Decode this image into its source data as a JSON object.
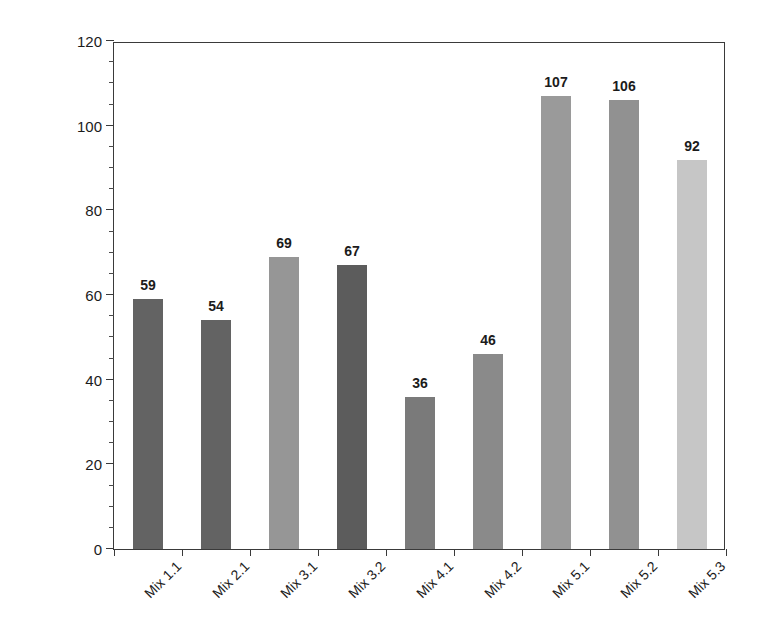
{
  "chart_data": {
    "type": "bar",
    "title": "",
    "xlabel": "",
    "ylabel": "Modulus of Stiffness, (MPa)",
    "categories": [
      "Mix 1.1",
      "Mix 2.1",
      "Mix 3.1",
      "Mix 3.2",
      "Mix 4.1",
      "Mix 4.2",
      "Mix 5.1",
      "Mix 5.2",
      "Mix 5.3"
    ],
    "values": [
      59,
      54,
      69,
      67,
      36,
      46,
      107,
      106,
      92
    ],
    "value_labels": [
      "59",
      "54",
      "69",
      "67",
      "36",
      "46",
      "107",
      "106",
      "92"
    ],
    "bar_colors": [
      "#636363",
      "#636363",
      "#969696",
      "#5c5c5c",
      "#7a7a7a",
      "#8a8a8a",
      "#9a9a9a",
      "#919191",
      "#c6c6c6"
    ],
    "ylim": [
      0,
      120
    ],
    "y_major_ticks": [
      0,
      20,
      40,
      60,
      80,
      100,
      120
    ],
    "y_major_tick_labels": [
      "0",
      "20",
      "40",
      "60",
      "80",
      "100",
      "120"
    ],
    "y_minor_tick_interval": 5,
    "grid": false,
    "legend": null,
    "axis_color": "#3a3a3a",
    "background": "#ffffff",
    "xlabel_rotation_deg": -45
  }
}
